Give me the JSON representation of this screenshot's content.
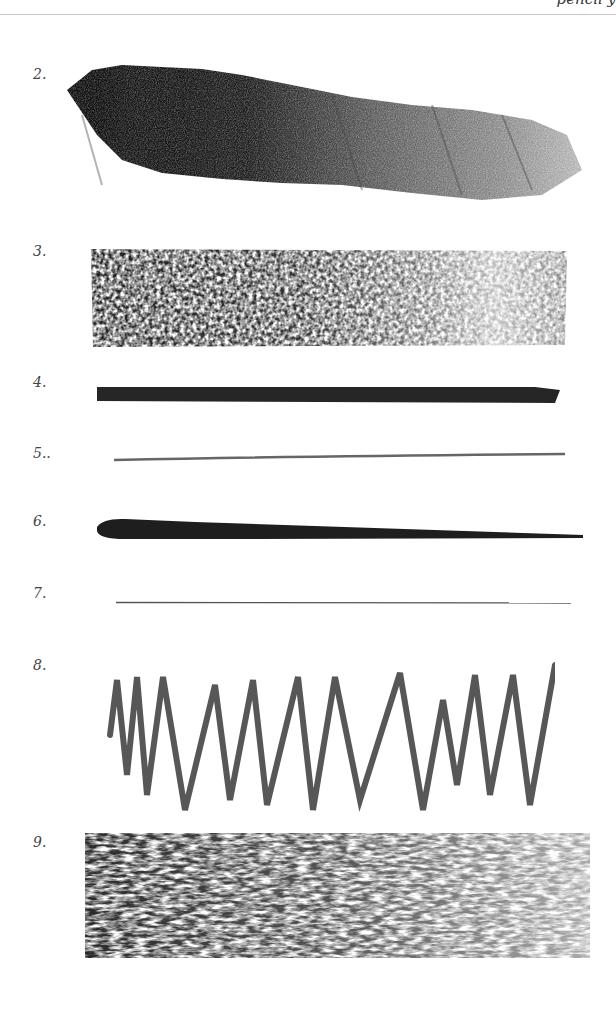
{
  "page": {
    "header_text": "pencil y",
    "background": "#ffffff"
  },
  "samples": [
    {
      "label": "2.",
      "kind": "diagonal hatched charcoal gradient (dark to light)",
      "color": "#1a1a1a"
    },
    {
      "label": "3.",
      "kind": "textured rectangular charcoal fill, dark left to light right",
      "color": "#2a2a2a"
    },
    {
      "label": "4.",
      "kind": "thick heavy horizontal line",
      "color": "#222222"
    },
    {
      "label": "5..",
      "kind": "thin light horizontal line",
      "color": "#555555"
    },
    {
      "label": "6.",
      "kind": "tapered horizontal stroke, thick left to thin right",
      "color": "#1e1e1e"
    },
    {
      "label": "7.",
      "kind": "very fine hairline",
      "color": "#444444"
    },
    {
      "label": "8.",
      "kind": "zigzag sawtooth stroke",
      "color": "#3a3a3a"
    },
    {
      "label": "9.",
      "kind": "dense vertical scribble hatching, fading to right",
      "color": "#333333"
    }
  ]
}
